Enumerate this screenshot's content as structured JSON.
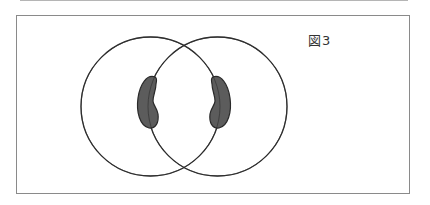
{
  "figure": {
    "label": "図3",
    "circles": [
      {
        "name": "left",
        "cx": 150.5,
        "cy": 106.5,
        "r": 69.5
      },
      {
        "name": "right",
        "cx": 217.5,
        "cy": 106.5,
        "r": 69.5
      }
    ],
    "shaded_regions": [
      {
        "name": "left-blob",
        "position": "left circle, straddling right circle's left boundary"
      },
      {
        "name": "right-blob",
        "position": "right circle, straddling left circle's right boundary"
      }
    ],
    "colors": {
      "circle_stroke": "#2e2e2e",
      "blob_fill": "#5c5c5c",
      "blob_stroke": "#2a2a2a",
      "frame_border": "#8a8a8a"
    }
  }
}
